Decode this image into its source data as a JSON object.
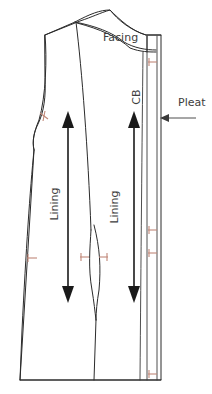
{
  "canvas": {
    "width": 212,
    "height": 394,
    "background": "#ffffff"
  },
  "colors": {
    "outline": "#2b2b2b",
    "notch": "#c08878",
    "grainline": "#1a1a1a",
    "label": "#3d3d3d",
    "background": "#ffffff"
  },
  "labels": {
    "facing": "Facing",
    "center_back": "CB",
    "lining_left": "Lining",
    "lining_right": "Lining",
    "pleat": "Pleat"
  },
  "annotations": [
    {
      "name": "facing-label",
      "text": "Facing",
      "x": 103,
      "y": 41,
      "rotation": 0
    },
    {
      "name": "center-back-label",
      "text": "CB",
      "x": 140,
      "y": 97,
      "rotation": -90
    },
    {
      "name": "lining-label-left",
      "text": "Lining",
      "x": 58,
      "y": 204,
      "rotation": -90
    },
    {
      "name": "lining-label-right",
      "text": "Lining",
      "x": 118,
      "y": 207,
      "rotation": -90
    },
    {
      "name": "pleat-label",
      "text": "Pleat",
      "x": 178,
      "y": 104,
      "rotation": 0
    }
  ],
  "grainlines": [
    {
      "name": "grainline-left",
      "x": 68,
      "top_y": 113,
      "bottom_y": 300,
      "head": "both"
    },
    {
      "name": "grainline-right",
      "x": 134,
      "top_y": 113,
      "bottom_y": 300,
      "head": "both"
    }
  ],
  "notches": [
    {
      "name": "notch-armhole-left",
      "x": 44,
      "y": 116
    },
    {
      "name": "notch-cb-upper",
      "x": 152,
      "y": 62
    },
    {
      "name": "notch-side-left-waist",
      "x": 36,
      "y": 258
    },
    {
      "name": "notch-dart-left-waist",
      "x": 84,
      "y": 257
    },
    {
      "name": "notch-dart-right-waist",
      "x": 103,
      "y": 257
    },
    {
      "name": "notch-cb-waist-upper",
      "x": 152,
      "y": 230
    },
    {
      "name": "notch-cb-waist-lower",
      "x": 152,
      "y": 253
    },
    {
      "name": "notch-cb-hem",
      "x": 152,
      "y": 374
    }
  ],
  "pleat_callout": {
    "name": "pleat-arrow",
    "from_x": 196,
    "to_x": 161,
    "y": 118
  },
  "geometry_note": "Flat sewing pattern: back bodice-to-hem panel with shoulder, armhole, side seam, vertical style seam, center back fold with pleat extension and a facing region at the upper back."
}
